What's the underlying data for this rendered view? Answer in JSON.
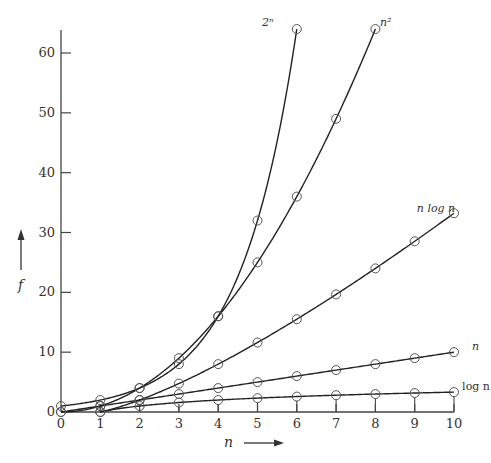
{
  "chart_data": {
    "type": "line",
    "title": "",
    "xlabel": "n",
    "ylabel": "f",
    "xlim": [
      0,
      10
    ],
    "ylim": [
      0,
      64
    ],
    "grid": false,
    "legend": "inline labels at curve ends",
    "x_ticks": [
      0,
      1,
      2,
      3,
      4,
      5,
      6,
      7,
      8,
      9,
      10
    ],
    "y_ticks": [
      0,
      10,
      20,
      30,
      40,
      50,
      60
    ],
    "series": [
      {
        "name": "log n",
        "label": "log n",
        "x": [
          1,
          2,
          3,
          4,
          5,
          6,
          7,
          8,
          9,
          10
        ],
        "values": [
          0,
          1,
          1.58,
          2,
          2.32,
          2.58,
          2.81,
          3,
          3.17,
          3.32
        ]
      },
      {
        "name": "n",
        "label": "n",
        "x": [
          0,
          1,
          2,
          3,
          4,
          5,
          6,
          7,
          8,
          9,
          10
        ],
        "values": [
          0,
          1,
          2,
          3,
          4,
          5,
          6,
          7,
          8,
          9,
          10
        ]
      },
      {
        "name": "n log n",
        "label": "n log n",
        "x": [
          1,
          2,
          3,
          4,
          5,
          6,
          7,
          8,
          9,
          10
        ],
        "values": [
          0,
          2,
          4.75,
          8,
          11.61,
          15.51,
          19.65,
          24,
          28.53,
          33.22
        ]
      },
      {
        "name": "n^2",
        "label": "n²",
        "x": [
          0,
          1,
          2,
          3,
          4,
          5,
          6,
          7,
          8
        ],
        "values": [
          0,
          1,
          4,
          9,
          16,
          25,
          36,
          49,
          64
        ]
      },
      {
        "name": "2^n",
        "label": "2ⁿ",
        "x": [
          0,
          1,
          2,
          3,
          4,
          5,
          6
        ],
        "values": [
          1,
          2,
          4,
          8,
          16,
          32,
          64
        ]
      }
    ]
  },
  "labels": {
    "x_axis": "n",
    "y_axis": "f"
  }
}
